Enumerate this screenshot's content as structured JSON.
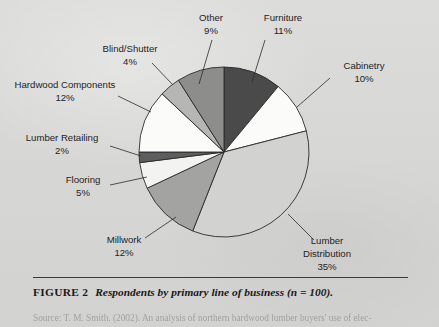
{
  "figure": {
    "number_label": "FIGURE 2",
    "title": "Respondents by primary line of business (n = 100).",
    "source": "Source: T. M. Smith. (2002). An analysis of northern hardwood lumber buyers' use of elec-",
    "source_prefix": "Source:"
  },
  "chart_data": {
    "type": "pie",
    "title": "Respondents by primary line of business (n = 100)",
    "total_n": 100,
    "units": "percent",
    "start_angle_deg": 0,
    "direction": "clockwise",
    "legend": "none",
    "grid": false,
    "categories": [
      "Furniture",
      "Cabinetry",
      "Lumber Distribution",
      "Millwork",
      "Flooring",
      "Lumber Retailing",
      "Hardwood Components",
      "Blind/Shutter",
      "Other"
    ],
    "values": [
      11,
      10,
      35,
      12,
      5,
      2,
      12,
      4,
      9
    ],
    "colors": [
      "#4a4a4a",
      "#fbfbfa",
      "#d2d2d0",
      "#a3a3a1",
      "#f3f3f1",
      "#5e5e5e",
      "#fbfbfa",
      "#b6b6b4",
      "#8d8d8b"
    ],
    "slices": [
      {
        "label": "Furniture",
        "value": 11,
        "value_text": "11%",
        "color": "#4a4a4a"
      },
      {
        "label": "Cabinetry",
        "value": 10,
        "value_text": "10%",
        "color": "#fbfbfa"
      },
      {
        "label": "Lumber Distribution",
        "value": 35,
        "value_text": "35%",
        "color": "#d2d2d0"
      },
      {
        "label": "Millwork",
        "value": 12,
        "value_text": "12%",
        "color": "#a3a3a1"
      },
      {
        "label": "Flooring",
        "value": 5,
        "value_text": "5%",
        "color": "#f3f3f1"
      },
      {
        "label": "Lumber Retailing",
        "value": 2,
        "value_text": "2%",
        "color": "#5e5e5e"
      },
      {
        "label": "Hardwood Components",
        "value": 12,
        "value_text": "12%",
        "color": "#fbfbfa"
      },
      {
        "label": "Blind/Shutter",
        "value": 4,
        "value_text": "4%",
        "color": "#b6b6b4"
      },
      {
        "label": "Other",
        "value": 9,
        "value_text": "9%",
        "color": "#8d8d8b"
      }
    ]
  },
  "labels": {
    "other": {
      "name": "Other",
      "pct": "9%"
    },
    "furniture": {
      "name": "Furniture",
      "pct": "11%"
    },
    "blind_shutter": {
      "name": "Blind/Shutter",
      "pct": "4%"
    },
    "cabinetry": {
      "name": "Cabinetry",
      "pct": "10%"
    },
    "hardwood_components": {
      "name": "Hardwood Components",
      "pct": "12%"
    },
    "lumber_retailing": {
      "name": "Lumber Retailing",
      "pct": "2%"
    },
    "flooring": {
      "name": "Flooring",
      "pct": "5%"
    },
    "millwork": {
      "name": "Millwork",
      "pct": "12%"
    },
    "lumber_distribution": {
      "name_line1": "Lumber",
      "name_line2": "Distribution",
      "pct": "35%"
    }
  }
}
